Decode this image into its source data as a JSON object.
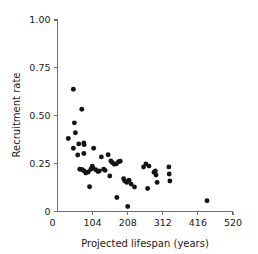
{
  "chart_data": {
    "type": "scatter",
    "title": "",
    "xlabel": "Projected lifespan (years)",
    "ylabel": "Recruitment rate",
    "xlim": [
      0,
      520
    ],
    "ylim": [
      0,
      1.0
    ],
    "grid": false,
    "legend": null,
    "xticks": [
      0,
      104,
      208,
      312,
      416,
      520
    ],
    "xtick_labels": [
      "0",
      "104",
      "208",
      "312",
      "416",
      "520"
    ],
    "yticks": [
      0,
      0.25,
      0.5,
      0.75,
      1.0
    ],
    "ytick_labels": [
      "0",
      "0.25",
      "0.50",
      "0.75",
      "1.00"
    ],
    "marker": "filled-circle",
    "marker_color": "#141414",
    "series": [
      {
        "name": "Recruitment rate vs projected lifespan",
        "points": [
          [
            47,
            0.638
          ],
          [
            32,
            0.381
          ],
          [
            50,
            0.463
          ],
          [
            53,
            0.411
          ],
          [
            47,
            0.33
          ],
          [
            72,
            0.534
          ],
          [
            63,
            0.353
          ],
          [
            78,
            0.358
          ],
          [
            79,
            0.349
          ],
          [
            60,
            0.295
          ],
          [
            78,
            0.303
          ],
          [
            66,
            0.221
          ],
          [
            72,
            0.219
          ],
          [
            78,
            0.213
          ],
          [
            84,
            0.201
          ],
          [
            91,
            0.206
          ],
          [
            99,
            0.221
          ],
          [
            103,
            0.236
          ],
          [
            104,
            0.229
          ],
          [
            107,
            0.33
          ],
          [
            113,
            0.218
          ],
          [
            120,
            0.209
          ],
          [
            124,
            0.212
          ],
          [
            130,
            0.285
          ],
          [
            137,
            0.221
          ],
          [
            141,
            0.215
          ],
          [
            150,
            0.296
          ],
          [
            155,
            0.185
          ],
          [
            158,
            0.264
          ],
          [
            162,
            0.256
          ],
          [
            168,
            0.247
          ],
          [
            175,
            0.249
          ],
          [
            181,
            0.26
          ],
          [
            186,
            0.263
          ],
          [
            196,
            0.171
          ],
          [
            199,
            0.16
          ],
          [
            205,
            0.152
          ],
          [
            212,
            0.163
          ],
          [
            218,
            0.143
          ],
          [
            228,
            0.128
          ],
          [
            95,
            0.129
          ],
          [
            176,
            0.073
          ],
          [
            208,
            0.026
          ],
          [
            267,
            0.12
          ],
          [
            255,
            0.232
          ],
          [
            262,
            0.248
          ],
          [
            271,
            0.237
          ],
          [
            286,
            0.205
          ],
          [
            290,
            0.212
          ],
          [
            292,
            0.19
          ],
          [
            295,
            0.152
          ],
          [
            330,
            0.233
          ],
          [
            331,
            0.196
          ],
          [
            333,
            0.159
          ],
          [
            443,
            0.056
          ]
        ]
      }
    ]
  },
  "axes": {
    "x_title": "Projected lifespan (years)",
    "y_title": "Recruitment rate"
  }
}
